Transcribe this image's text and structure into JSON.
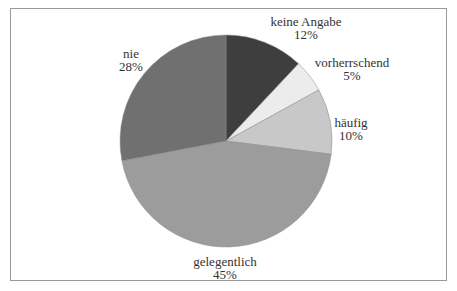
{
  "chart_data": {
    "type": "pie",
    "title": "",
    "categories": [
      "keine Angabe",
      "vorherrschend",
      "häufig",
      "gelegentlich",
      "nie"
    ],
    "values": [
      12,
      5,
      10,
      45,
      28
    ],
    "unit": "%",
    "colors": [
      "#3e3e3e",
      "#ececec",
      "#c8c8c8",
      "#9c9c9c",
      "#707070"
    ],
    "start_angle_deg": 0,
    "direction": "clockwise",
    "legend": "none (inline labels)",
    "labels": [
      {
        "name": "keine Angabe",
        "pct": "12%"
      },
      {
        "name": "vorherrschend",
        "pct": "5%"
      },
      {
        "name": "häufig",
        "pct": "10%"
      },
      {
        "name": "gelegentlich",
        "pct": "45%"
      },
      {
        "name": "nie",
        "pct": "28%"
      }
    ]
  }
}
